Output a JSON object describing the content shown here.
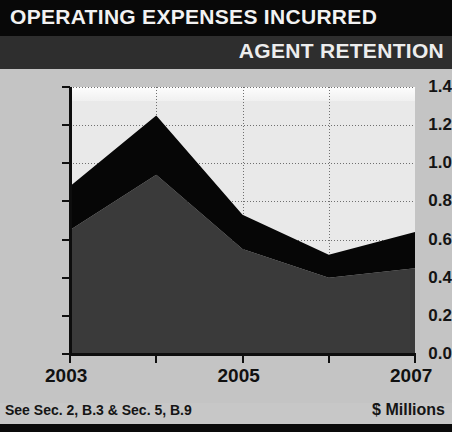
{
  "header": {
    "title": "OPERATING EXPENSES INCURRED",
    "subtitle": "AGENT RETENTION"
  },
  "footer": {
    "reference": "See Sec. 2, B.3 & Sec. 5, B.9",
    "units": "$ Millions"
  },
  "colors": {
    "header_bg": "#080808",
    "subheader_bg": "#2e2e2e",
    "page_bg": "#c4c4c4",
    "plot_bg": "#e9e9e9",
    "series_lower": "#3a3a3a",
    "series_upper": "#060606",
    "axis": "#0d0d0d",
    "gridline": "#6f6f6f"
  },
  "chart_data": {
    "type": "area",
    "title": "OPERATING EXPENSES INCURRED",
    "subtitle": "AGENT RETENTION",
    "xlabel": "",
    "ylabel": "",
    "units": "$ Millions",
    "stacked": true,
    "grid": true,
    "legend": "none",
    "x": [
      2003,
      2004,
      2005,
      2006,
      2007
    ],
    "xtick_labels": [
      "2003",
      "",
      "2005",
      "",
      "2007"
    ],
    "xlim": [
      2003,
      2007
    ],
    "ylim": [
      0.0,
      1.4
    ],
    "ytick_labels": [
      "1.4",
      "1.2",
      "1.0",
      "0.8",
      "0.6",
      "0.4",
      "0.2",
      "0.0"
    ],
    "ytick_values": [
      1.4,
      1.2,
      1.0,
      0.8,
      0.6,
      0.4,
      0.2,
      0.0
    ],
    "series": [
      {
        "name": "lower-band",
        "color": "#3a3a3a",
        "values": [
          0.65,
          0.94,
          0.55,
          0.4,
          0.45
        ]
      },
      {
        "name": "upper-band",
        "color": "#060606",
        "values": [
          0.23,
          0.31,
          0.18,
          0.12,
          0.19
        ]
      }
    ],
    "cumulative_totals": [
      0.88,
      1.25,
      0.73,
      0.52,
      0.64
    ]
  }
}
